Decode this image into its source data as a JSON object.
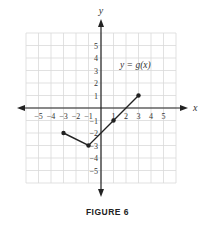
{
  "chart_data": {
    "type": "line",
    "title": "",
    "caption": "FIGURE 6",
    "annotation": "y = g(x)",
    "xlabel": "x",
    "ylabel": "y",
    "xlim": [
      -6,
      6
    ],
    "ylim": [
      -6,
      6
    ],
    "grid": true,
    "x_tick_labels": [
      "-5",
      "-4",
      "-3",
      "-2",
      "-1",
      "1",
      "2",
      "3",
      "4",
      "5"
    ],
    "y_tick_labels": [
      "5",
      "4",
      "3",
      "2",
      "1",
      "-1",
      "-2",
      "-3",
      "-4",
      "-5"
    ],
    "series": [
      {
        "name": "g(x)",
        "points": [
          [
            -3,
            -2
          ],
          [
            -1,
            -3
          ],
          [
            1,
            -1
          ],
          [
            3,
            1
          ]
        ],
        "x": [
          -3,
          -1,
          1,
          3
        ],
        "y": [
          -2,
          -3,
          -1,
          1
        ],
        "endpoints": "closed",
        "color": "#222222"
      }
    ]
  },
  "colors": {
    "grid": "#d9d9d9",
    "axis": "#222222",
    "text": "#333333"
  }
}
